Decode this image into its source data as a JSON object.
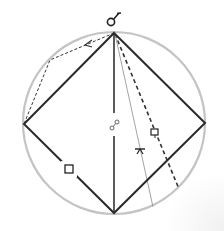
{
  "diagram": {
    "type": "geometric-construction",
    "colors": {
      "circle": "#c4c4c4",
      "diamond": "#2a2a2a",
      "dashed": "#333333",
      "thin_line": "#888888",
      "symbol": "#222222"
    },
    "circle": {
      "cx": 114,
      "cy": 123,
      "r": 91
    },
    "diamond": {
      "top": [
        114,
        33
      ],
      "right": [
        205,
        123
      ],
      "bottom": [
        114,
        213
      ],
      "left": [
        24,
        124
      ]
    },
    "symbols": [
      {
        "name": "top-pin-symbol",
        "glyph": "♂",
        "x": 114,
        "y": 20
      },
      {
        "name": "center-link-symbol",
        "glyph": "∞",
        "x": 114,
        "y": 126
      },
      {
        "name": "left-edge-square-symbol",
        "glyph": "□",
        "x": 69,
        "y": 169
      },
      {
        "name": "thin-line-marker-symbol",
        "glyph": "ᴛ",
        "x": 140,
        "y": 150
      },
      {
        "name": "dashed-line-flag-symbol",
        "glyph": "⊏",
        "x": 155,
        "y": 132
      }
    ]
  }
}
